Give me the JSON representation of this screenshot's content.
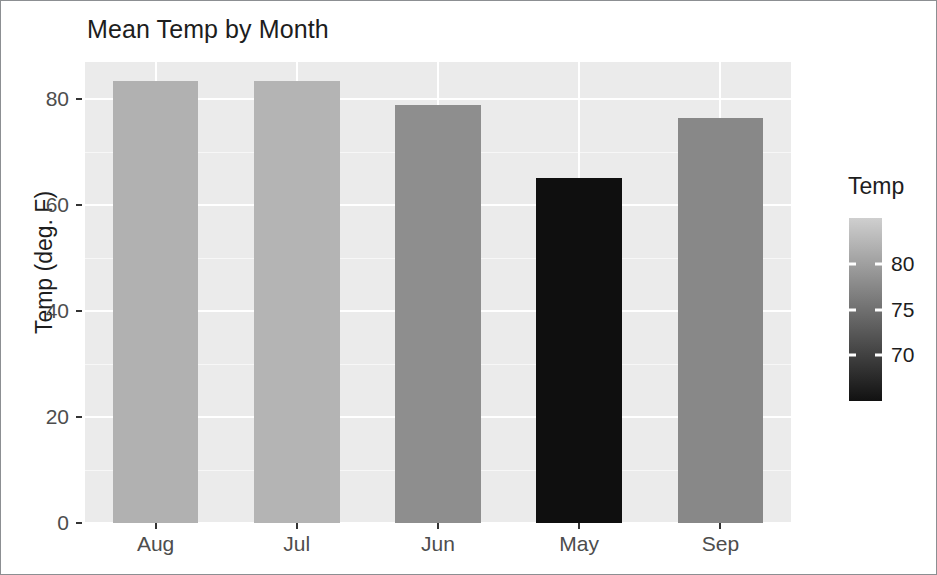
{
  "chart_data": {
    "type": "bar",
    "title": "Mean Temp by Month",
    "xlabel": "",
    "ylabel": "Temp (deg. F)",
    "categories": [
      "Aug",
      "Jul",
      "Jun",
      "May",
      "Sep"
    ],
    "values": [
      83.5,
      83.4,
      78.8,
      65.2,
      76.4
    ],
    "series": [
      {
        "name": "Temp",
        "values": [
          83.5,
          83.4,
          78.8,
          65.2,
          76.4
        ]
      }
    ],
    "bar_colors": [
      "#b1b1b1",
      "#b4b4b4",
      "#8e8e8e",
      "#0f0f0f",
      "#888888"
    ],
    "ylim": [
      0,
      87
    ],
    "y_ticks": [
      0,
      20,
      40,
      60,
      80
    ],
    "y_tick_labels": [
      "0",
      "20",
      "40",
      "60",
      "80"
    ],
    "grid": true,
    "legend": {
      "title": "Temp",
      "position": "right",
      "type": "colorbar",
      "ticks": [
        70,
        75,
        80
      ],
      "tick_labels": [
        "70",
        "75",
        "80"
      ],
      "range": [
        65,
        85
      ],
      "gradient_low_color": "#111111",
      "gradient_high_color": "#cfcfcf"
    },
    "panel_background": "#ebebeb",
    "gridline_color": "#ffffff",
    "axis_text_color": "#4d4d4d",
    "title_color": "#1d1d1d"
  },
  "chart": {
    "title": "Mean Temp by Month",
    "y_axis": {
      "title": "Temp (deg. F)",
      "ticks": [
        {
          "label": "80",
          "value": 80
        },
        {
          "label": "60",
          "value": 60
        },
        {
          "label": "40",
          "value": 40
        },
        {
          "label": "20",
          "value": 20
        },
        {
          "label": "0",
          "value": 0
        }
      ]
    },
    "x_axis": {
      "title": "",
      "ticks": [
        {
          "label": "Aug"
        },
        {
          "label": "Jul"
        },
        {
          "label": "Jun"
        },
        {
          "label": "May"
        },
        {
          "label": "Sep"
        }
      ]
    },
    "bars": [
      {
        "category": "Aug",
        "value": 83.5,
        "color": "#b1b1b1"
      },
      {
        "category": "Jul",
        "value": 83.4,
        "color": "#b4b4b4"
      },
      {
        "category": "Jun",
        "value": 78.8,
        "color": "#8e8e8e"
      },
      {
        "category": "May",
        "value": 65.2,
        "color": "#0f0f0f"
      },
      {
        "category": "Sep",
        "value": 76.4,
        "color": "#888888"
      }
    ],
    "legend": {
      "title": "Temp",
      "labels": [
        {
          "label": "80",
          "value": 80
        },
        {
          "label": "75",
          "value": 75
        },
        {
          "label": "70",
          "value": 70
        }
      ]
    }
  }
}
